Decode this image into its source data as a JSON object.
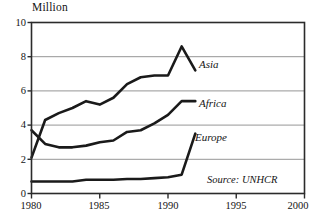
{
  "chart_data": {
    "type": "line",
    "title": "Million",
    "xlabel": "",
    "ylabel": "Million",
    "xlim": [
      1980,
      2000
    ],
    "ylim": [
      0,
      10
    ],
    "grid": true,
    "legend_position": "inline-right-of-series",
    "xticks": [
      1980,
      1985,
      1990,
      1995,
      2000
    ],
    "yticks": [
      0,
      2,
      4,
      6,
      8,
      10
    ],
    "xtick_labels": [
      "1980",
      "1985",
      "1990",
      "1995",
      "2000"
    ],
    "ytick_labels": [
      "0",
      "2",
      "4",
      "6",
      "8",
      "10"
    ],
    "annotations": [
      {
        "name": "source",
        "text": "Source: UNHCR"
      }
    ],
    "x": [
      1980,
      1981,
      1982,
      1983,
      1984,
      1985,
      1986,
      1987,
      1988,
      1989,
      1990,
      1991,
      1992
    ],
    "series": [
      {
        "name": "Asia",
        "label": "Asia",
        "color": "#1a1a1a",
        "values": [
          2.1,
          4.3,
          4.7,
          5.0,
          5.4,
          5.2,
          5.6,
          6.4,
          6.8,
          6.9,
          6.9,
          8.6,
          7.2
        ]
      },
      {
        "name": "Africa",
        "label": "Africa",
        "color": "#1a1a1a",
        "values": [
          3.7,
          2.9,
          2.7,
          2.7,
          2.8,
          3.0,
          3.1,
          3.6,
          3.7,
          4.1,
          4.6,
          5.4,
          5.4
        ]
      },
      {
        "name": "Europe",
        "label": "Europe",
        "color": "#1a1a1a",
        "values": [
          0.7,
          0.7,
          0.7,
          0.7,
          0.8,
          0.8,
          0.8,
          0.85,
          0.85,
          0.9,
          0.95,
          1.1,
          3.5
        ]
      }
    ]
  }
}
